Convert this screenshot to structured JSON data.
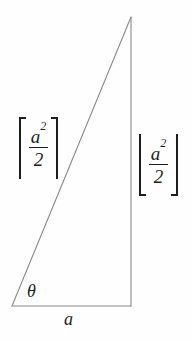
{
  "figure": {
    "name": "right-triangle-ceiling-floor-diagram",
    "background_color": "#fefefe",
    "stroke_color": "#8a8a8a",
    "text_color": "#1d1d1d",
    "width": 191,
    "height": 340
  },
  "triangle": {
    "apex": {
      "x": 131,
      "y": 17
    },
    "bottom_left": {
      "x": 12,
      "y": 306
    },
    "bottom_right": {
      "x": 131,
      "y": 306
    },
    "stroke_width": 1
  },
  "labels": {
    "left": {
      "notation": "ceiling",
      "open_bracket": "⌈",
      "close_bracket": "⌉",
      "numerator_base": "a",
      "numerator_exponent": "2",
      "denominator": "2",
      "plain_text": "⌈a²/2⌉"
    },
    "right": {
      "notation": "floor",
      "open_bracket": "⌊",
      "close_bracket": "⌋",
      "numerator_base": "a",
      "numerator_exponent": "2",
      "denominator": "2",
      "plain_text": "⌊a²/2⌋"
    },
    "angle": {
      "symbol": "θ"
    },
    "base": {
      "symbol": "a"
    }
  }
}
